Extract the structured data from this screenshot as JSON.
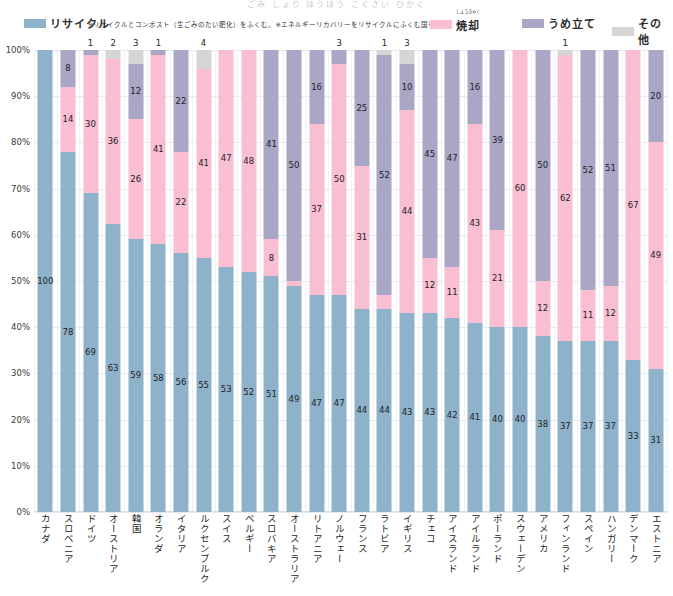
{
  "title_faint": "ごみ しょり ほうほう こくさい ひかく",
  "legend": {
    "items": [
      {
        "name": "recycle",
        "label": "リサイクル",
        "color": "#8fb2cb"
      },
      {
        "name": "incineration",
        "label": "焼却",
        "ruby": "しょうきゃく",
        "color": "#f9bed1"
      },
      {
        "name": "landfill",
        "label": "うめ立て",
        "color": "#a9a6c6"
      },
      {
        "name": "other",
        "label": "その他",
        "color": "#d5d5d5"
      }
    ],
    "notes": "※リサイクルとコンポスト（生ごみのたい肥化）をふくむ。※エネルギーリカバリーをリサイクルにふくむ国もある。"
  },
  "chart_data": {
    "type": "bar",
    "stacked": true,
    "title": "",
    "xlabel": "",
    "ylabel": "",
    "ylim": [
      0,
      100
    ],
    "grid": true,
    "legend_position": "top",
    "yticks": [
      "0%",
      "10%",
      "20%",
      "30%",
      "40%",
      "50%",
      "60%",
      "70%",
      "80%",
      "90%",
      "100%"
    ],
    "series_names": [
      "リサイクル",
      "焼却",
      "うめ立て",
      "その他"
    ],
    "series_colors": [
      "#8fb2cb",
      "#f9bed1",
      "#a9a6c6",
      "#d5d5d5"
    ],
    "categories": [
      "カナダ",
      "スロベニア",
      "ドイツ",
      "オーストリア",
      "韓国",
      "オランダ",
      "イタリア",
      "ルクセンブルク",
      "スイス",
      "ベルギー",
      "スロバキア",
      "オーストラリア",
      "リトアニア",
      "ノルウェー",
      "フランス",
      "ラトビア",
      "イギリス",
      "チェコ",
      "アイスランド",
      "アイルランド",
      "ポーランド",
      "スウェーデン",
      "アメリカ",
      "フィンランド",
      "スペイン",
      "ハンガリー",
      "デンマーク",
      "エストニア"
    ],
    "series": [
      {
        "name": "リサイクル",
        "values": [
          100,
          78,
          69,
          63,
          59,
          58,
          56,
          55,
          53,
          52,
          51,
          49,
          47,
          47,
          44,
          44,
          43,
          43,
          42,
          41,
          40,
          40,
          38,
          37,
          37,
          37,
          33,
          31
        ]
      },
      {
        "name": "焼却",
        "values": [
          0,
          14,
          30,
          36,
          26,
          41,
          22,
          41,
          47,
          48,
          8,
          1,
          37,
          50,
          31,
          3,
          44,
          12,
          11,
          43,
          21,
          60,
          12,
          62,
          11,
          12,
          67,
          49
        ]
      },
      {
        "name": "うめ立て",
        "values": [
          0,
          8,
          1,
          0,
          12,
          1,
          22,
          0,
          0,
          0,
          41,
          50,
          16,
          3,
          25,
          52,
          10,
          45,
          47,
          16,
          39,
          0,
          50,
          0,
          52,
          51,
          0,
          20
        ]
      },
      {
        "name": "その他",
        "values": [
          0,
          0,
          0,
          2,
          3,
          0,
          0,
          4,
          0,
          0,
          0,
          0,
          0,
          0,
          0,
          1,
          3,
          0,
          0,
          0,
          0,
          0,
          0,
          1,
          0,
          0,
          0,
          0
        ]
      }
    ]
  }
}
